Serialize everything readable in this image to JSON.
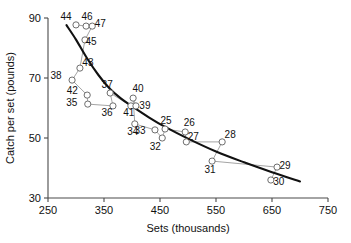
{
  "chart_data": {
    "type": "scatter",
    "title": "",
    "xlabel": "Sets (thousands)",
    "ylabel": "Catch per set (pounds)",
    "xlim": [
      250,
      750
    ],
    "ylim": [
      30,
      90
    ],
    "xticks": [
      250,
      350,
      450,
      550,
      650,
      750
    ],
    "yticks": [
      30,
      50,
      70,
      90
    ],
    "grid": false,
    "legend": "none",
    "point_label_field": "year_code",
    "points": [
      {
        "label": "44",
        "x": 300,
        "y": 87.7,
        "label_dx": -10,
        "label_dy": -5
      },
      {
        "label": "46",
        "x": 318,
        "y": 87.3,
        "label_dx": 1,
        "label_dy": -6
      },
      {
        "label": "47",
        "x": 329,
        "y": 87.3,
        "label_dx": 8,
        "label_dy": 1
      },
      {
        "label": "45",
        "x": 316,
        "y": 82.7,
        "label_dx": 6,
        "label_dy": 5
      },
      {
        "label": "43",
        "x": 307,
        "y": 73.3,
        "label_dx": 8,
        "label_dy": -2
      },
      {
        "label": "38",
        "x": 293,
        "y": 69.3,
        "label_dx": -16,
        "label_dy": -1
      },
      {
        "label": "42",
        "x": 320,
        "y": 64.3,
        "label_dx": -15,
        "label_dy": -1
      },
      {
        "label": "35",
        "x": 321,
        "y": 61.3,
        "label_dx": -16,
        "label_dy": 2
      },
      {
        "label": "37",
        "x": 361,
        "y": 65.0,
        "label_dx": -3,
        "label_dy": -5
      },
      {
        "label": "36",
        "x": 366,
        "y": 60.7,
        "label_dx": -6,
        "label_dy": 10
      },
      {
        "label": "40",
        "x": 402,
        "y": 63.3,
        "label_dx": 5,
        "label_dy": -6
      },
      {
        "label": "41",
        "x": 398,
        "y": 60.7,
        "label_dx": -2,
        "label_dy": 10
      },
      {
        "label": "39",
        "x": 407,
        "y": 60.7,
        "label_dx": 9,
        "label_dy": 3
      },
      {
        "label": "34",
        "x": 405,
        "y": 54.7,
        "label_dx": -2,
        "label_dy": 11
      },
      {
        "label": "33",
        "x": 441,
        "y": 52.7,
        "label_dx": -15,
        "label_dy": 4
      },
      {
        "label": "25",
        "x": 459,
        "y": 53.0,
        "label_dx": 1,
        "label_dy": -5
      },
      {
        "label": "32",
        "x": 454,
        "y": 50.0,
        "label_dx": -7,
        "label_dy": 12
      },
      {
        "label": "26",
        "x": 495,
        "y": 52.0,
        "label_dx": 4,
        "label_dy": -6
      },
      {
        "label": "27",
        "x": 497,
        "y": 48.7,
        "label_dx": 7,
        "label_dy": -2
      },
      {
        "label": "28",
        "x": 561,
        "y": 48.7,
        "label_dx": 8,
        "label_dy": -4
      },
      {
        "label": "31",
        "x": 543,
        "y": 42.3,
        "label_dx": -2,
        "label_dy": 12
      },
      {
        "label": "29",
        "x": 659,
        "y": 40.3,
        "label_dx": 8,
        "label_dy": 2
      },
      {
        "label": "30",
        "x": 648,
        "y": 36.0,
        "label_dx": 8,
        "label_dy": 5
      }
    ],
    "connection_path_order": [
      "44",
      "46",
      "47",
      "45",
      "43",
      "38",
      "42",
      "35",
      "36",
      "37",
      "41",
      "39",
      "40",
      "34",
      "33",
      "32",
      "25",
      "26",
      "27",
      "28",
      "31",
      "29",
      "30"
    ],
    "fit_curve_note": "smooth declining fitted curve through the cloud",
    "fit_curve_points": [
      {
        "x": 283,
        "y": 87.6
      },
      {
        "x": 300,
        "y": 82.8
      },
      {
        "x": 320,
        "y": 76.5
      },
      {
        "x": 340,
        "y": 71.0
      },
      {
        "x": 360,
        "y": 66.5
      },
      {
        "x": 380,
        "y": 63.2
      },
      {
        "x": 400,
        "y": 60.6
      },
      {
        "x": 430,
        "y": 56.9
      },
      {
        "x": 460,
        "y": 53.6
      },
      {
        "x": 500,
        "y": 49.8
      },
      {
        "x": 550,
        "y": 45.5
      },
      {
        "x": 600,
        "y": 41.9
      },
      {
        "x": 650,
        "y": 38.6
      },
      {
        "x": 700,
        "y": 35.5
      }
    ]
  }
}
